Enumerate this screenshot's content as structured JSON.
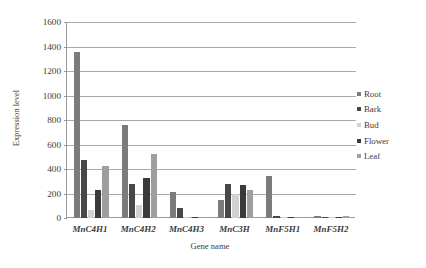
{
  "chart_data": {
    "type": "bar",
    "title": "",
    "xlabel": "Gene name",
    "ylabel": "Expression level",
    "ylim": [
      0,
      1600
    ],
    "yticks": [
      0,
      200,
      400,
      600,
      800,
      1000,
      1200,
      1400,
      1600
    ],
    "ytick_labels": [
      "0",
      "200",
      "400",
      "600",
      "800",
      "1000",
      "1200",
      "1400",
      "1600"
    ],
    "grid": "horizontal",
    "legend_position": "right",
    "categories": [
      "MnC4H1",
      "MnC4H2",
      "MnC4H3",
      "MnC3H",
      "MnF5H1",
      "MnF5H2"
    ],
    "series": [
      {
        "name": "Root",
        "color": "#7c7c7c",
        "values": [
          1355,
          760,
          210,
          150,
          340,
          18
        ]
      },
      {
        "name": "Bark",
        "color": "#474747",
        "values": [
          475,
          275,
          80,
          275,
          20,
          5
        ]
      },
      {
        "name": "Bud",
        "color": "#d2d2d2",
        "values": [
          65,
          110,
          6,
          200,
          5,
          4
        ]
      },
      {
        "name": "Flower",
        "color": "#3a3a3a",
        "values": [
          230,
          330,
          4,
          270,
          4,
          3
        ]
      },
      {
        "name": "Leaf",
        "color": "#9e9e9e",
        "values": [
          422,
          520,
          8,
          230,
          12,
          18
        ]
      }
    ]
  },
  "legend": {
    "items": [
      {
        "label": "Root"
      },
      {
        "label": "Bark"
      },
      {
        "label": "Bud"
      },
      {
        "label": "Flower"
      },
      {
        "label": "Leaf"
      }
    ]
  },
  "axes": {
    "y_title": "Expression level",
    "x_title": "Gene name"
  }
}
